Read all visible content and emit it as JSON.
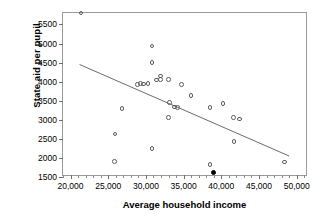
{
  "chart_data": {
    "type": "scatter",
    "title": "",
    "xlabel": "Average household income",
    "ylabel": "State aid per pupil",
    "xlim": [
      19000,
      51500
    ],
    "ylim": [
      1500,
      5800
    ],
    "grid": false,
    "legend": null,
    "xticks": [
      20000,
      25000,
      30000,
      35000,
      40000,
      45000,
      50000
    ],
    "xtick_labels": [
      "20,000",
      "25,000",
      "30,000",
      "35,000",
      "40,000",
      "45,000",
      "50,000"
    ],
    "yticks": [
      1500,
      2000,
      2500,
      3000,
      3500,
      4000,
      4500,
      5000,
      5500
    ],
    "ytick_labels": [
      "1500",
      "2000",
      "2500",
      "3000",
      "3500",
      "4000",
      "4500",
      "5000",
      "5500"
    ],
    "x_minor_tick_step": 1000,
    "series": [
      {
        "name": "districts",
        "marker": "open-circle",
        "points": [
          {
            "x": 21400,
            "y": 5800
          },
          {
            "x": 30800,
            "y": 4930
          },
          {
            "x": 30800,
            "y": 4500
          },
          {
            "x": 31900,
            "y": 4150
          },
          {
            "x": 31900,
            "y": 4060
          },
          {
            "x": 31400,
            "y": 4040
          },
          {
            "x": 33000,
            "y": 4050
          },
          {
            "x": 29300,
            "y": 3950
          },
          {
            "x": 29700,
            "y": 3940
          },
          {
            "x": 28900,
            "y": 3930
          },
          {
            "x": 30300,
            "y": 3950
          },
          {
            "x": 34700,
            "y": 3930
          },
          {
            "x": 36000,
            "y": 3630
          },
          {
            "x": 26800,
            "y": 3290
          },
          {
            "x": 33100,
            "y": 3460
          },
          {
            "x": 33800,
            "y": 3340
          },
          {
            "x": 34200,
            "y": 3330
          },
          {
            "x": 38500,
            "y": 3320
          },
          {
            "x": 40200,
            "y": 3430
          },
          {
            "x": 41600,
            "y": 3060
          },
          {
            "x": 42400,
            "y": 3020
          },
          {
            "x": 33000,
            "y": 3060
          },
          {
            "x": 25900,
            "y": 2630
          },
          {
            "x": 41700,
            "y": 2430
          },
          {
            "x": 30800,
            "y": 2250
          },
          {
            "x": 25800,
            "y": 1910
          },
          {
            "x": 38500,
            "y": 1820
          },
          {
            "x": 48400,
            "y": 1890
          }
        ]
      },
      {
        "name": "highlighted-district",
        "marker": "filled-circle",
        "points": [
          {
            "x": 38900,
            "y": 1610
          }
        ]
      }
    ],
    "fit_line": {
      "name": "least-squares-regression-line",
      "x0": 21200,
      "y0": 4450,
      "x1": 49000,
      "y1": 2050
    }
  }
}
